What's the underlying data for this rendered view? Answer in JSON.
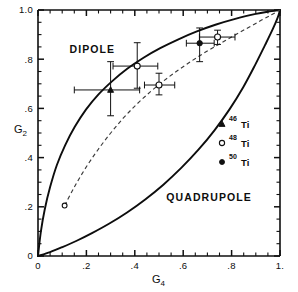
{
  "chart_data": {
    "type": "scatter",
    "title": "",
    "xlabel": "G4",
    "ylabel": "G2",
    "xlim": [
      0,
      1
    ],
    "ylim": [
      0,
      1
    ],
    "grid": false,
    "x_tick_labels": [
      "0",
      ".2",
      ".4",
      ".6",
      ".8",
      "1."
    ],
    "x_tick_values": [
      0,
      0.2,
      0.4,
      0.6,
      0.8,
      1.0
    ],
    "y_tick_labels": [
      "0",
      ".2",
      ".4",
      ".6",
      ".8",
      "1.0"
    ],
    "y_tick_values": [
      0,
      0.2,
      0.4,
      0.6,
      0.8,
      1.0
    ],
    "minor_tick_step": 0.05,
    "annotations": [
      {
        "text": "DIPOLE",
        "x": 0.13,
        "y": 0.825
      },
      {
        "text": "QUADRUPOLE",
        "x": 0.53,
        "y": 0.225
      }
    ],
    "legend_position": "right-middle",
    "legend": [
      {
        "label_sup": "46",
        "label": "Ti",
        "marker": "filled-triangle"
      },
      {
        "label_sup": "48",
        "label": "Ti",
        "marker": "open-circle"
      },
      {
        "label_sup": "50",
        "label": "Ti",
        "marker": "filled-circle"
      }
    ],
    "curves": [
      {
        "name": "dipole-quadrupole-upper-boundary",
        "style": "solid",
        "points": [
          [
            0.0,
            0.0
          ],
          [
            0.012,
            0.1
          ],
          [
            0.028,
            0.19
          ],
          [
            0.05,
            0.28
          ],
          [
            0.078,
            0.37
          ],
          [
            0.112,
            0.45
          ],
          [
            0.152,
            0.525
          ],
          [
            0.198,
            0.595
          ],
          [
            0.25,
            0.657
          ],
          [
            0.308,
            0.712
          ],
          [
            0.37,
            0.762
          ],
          [
            0.436,
            0.806
          ],
          [
            0.505,
            0.845
          ],
          [
            0.578,
            0.88
          ],
          [
            0.654,
            0.912
          ],
          [
            0.733,
            0.94
          ],
          [
            0.815,
            0.964
          ],
          [
            0.9,
            0.984
          ],
          [
            0.95,
            0.993
          ],
          [
            1.0,
            1.0
          ]
        ]
      },
      {
        "name": "quadrupole-lower-boundary",
        "style": "solid",
        "points": [
          [
            0.0,
            0.0
          ],
          [
            0.05,
            0.016
          ],
          [
            0.1,
            0.036
          ],
          [
            0.16,
            0.062
          ],
          [
            0.225,
            0.094
          ],
          [
            0.295,
            0.132
          ],
          [
            0.368,
            0.177
          ],
          [
            0.443,
            0.23
          ],
          [
            0.518,
            0.29
          ],
          [
            0.592,
            0.358
          ],
          [
            0.663,
            0.432
          ],
          [
            0.73,
            0.512
          ],
          [
            0.792,
            0.597
          ],
          [
            0.848,
            0.686
          ],
          [
            0.897,
            0.776
          ],
          [
            0.938,
            0.857
          ],
          [
            0.97,
            0.922
          ],
          [
            0.99,
            0.968
          ],
          [
            1.0,
            1.0
          ]
        ]
      },
      {
        "name": "intermediate-dashed-curve",
        "style": "dashed",
        "points": [
          [
            0.11,
            0.205
          ],
          [
            0.15,
            0.28
          ],
          [
            0.195,
            0.355
          ],
          [
            0.245,
            0.428
          ],
          [
            0.298,
            0.497
          ],
          [
            0.352,
            0.56
          ],
          [
            0.408,
            0.617
          ],
          [
            0.465,
            0.668
          ],
          [
            0.522,
            0.714
          ],
          [
            0.58,
            0.756
          ],
          [
            0.638,
            0.795
          ],
          [
            0.696,
            0.831
          ],
          [
            0.754,
            0.864
          ],
          [
            0.812,
            0.897
          ],
          [
            0.868,
            0.928
          ],
          [
            0.922,
            0.958
          ],
          [
            0.965,
            0.981
          ],
          [
            1.0,
            1.0
          ]
        ],
        "endpoint_marker": {
          "x": 0.11,
          "y": 0.205,
          "marker": "open-circle"
        }
      }
    ],
    "points": [
      {
        "series": "46Ti",
        "marker": "filled-triangle",
        "x": 0.3,
        "y": 0.675,
        "xerr_low": 0.15,
        "xerr_high": 0.12,
        "yerr_low": 0.105,
        "yerr_high": 0.115
      },
      {
        "series": "48Ti",
        "marker": "open-circle",
        "x": 0.41,
        "y": 0.772,
        "xerr_low": 0.1,
        "xerr_high": 0.085,
        "yerr_low": 0.09,
        "yerr_high": 0.095
      },
      {
        "series": "48Ti",
        "marker": "open-circle",
        "x": 0.5,
        "y": 0.695,
        "xerr_low": 0.06,
        "xerr_high": 0.065,
        "yerr_low": 0.04,
        "yerr_high": 0.048
      },
      {
        "series": "50Ti",
        "marker": "filled-circle",
        "x": 0.668,
        "y": 0.865,
        "xerr_low": 0.055,
        "xerr_high": 0.06,
        "yerr_low": 0.075,
        "yerr_high": 0.062
      },
      {
        "series": "48Ti",
        "marker": "open-circle",
        "x": 0.742,
        "y": 0.89,
        "xerr_low": 0.075,
        "xerr_high": 0.072,
        "yerr_low": 0.03,
        "yerr_high": 0.028
      }
    ]
  },
  "colors": {
    "ink": "#101010",
    "dashed": "#3a3a3a",
    "background": "#ffffff"
  }
}
